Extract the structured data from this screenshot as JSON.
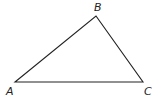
{
  "diagram": {
    "type": "triangle",
    "stroke_color": "#222222",
    "background": "#ffffff",
    "vertices": [
      {
        "label": "A",
        "x": 15,
        "y": 82,
        "label_x": 6,
        "label_y": 95
      },
      {
        "label": "B",
        "x": 96,
        "y": 16,
        "label_x": 94,
        "label_y": 11
      },
      {
        "label": "C",
        "x": 143,
        "y": 82,
        "label_x": 144,
        "label_y": 95
      }
    ]
  }
}
